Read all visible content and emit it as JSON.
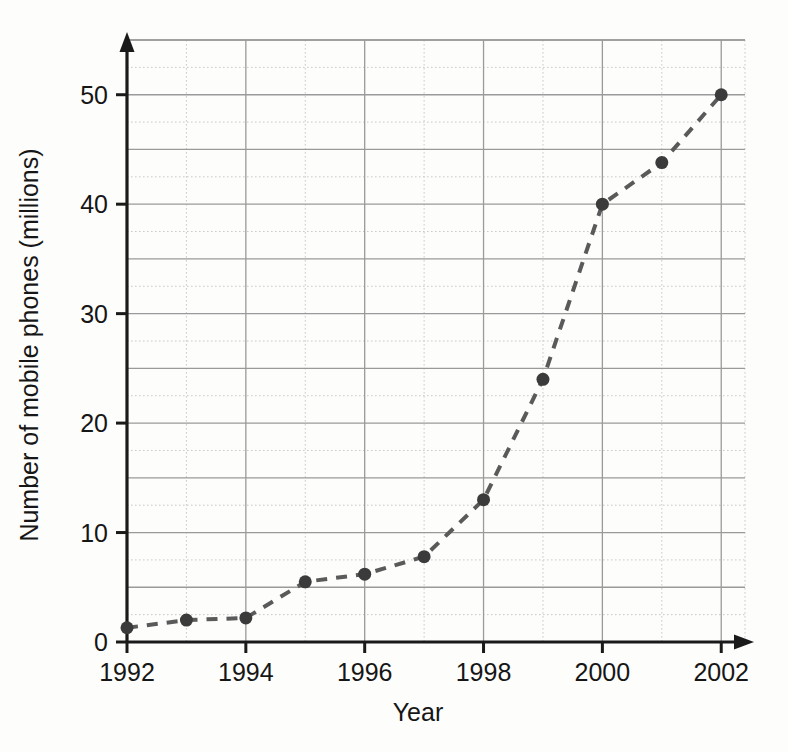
{
  "chart_data": {
    "type": "line",
    "title": "",
    "xlabel": "Year",
    "ylabel": "Number of mobile phones (millions)",
    "x": [
      1992,
      1993,
      1994,
      1995,
      1996,
      1997,
      1998,
      1999,
      2000,
      2001,
      2002
    ],
    "values": [
      1.3,
      2.0,
      2.2,
      5.5,
      6.2,
      7.8,
      13.0,
      24.0,
      40.0,
      43.8,
      50.0
    ],
    "series": [
      {
        "name": "Number of mobile phones (millions)",
        "values": [
          1.3,
          2.0,
          2.2,
          5.5,
          6.2,
          7.8,
          13.0,
          24.0,
          40.0,
          43.8,
          50.0
        ]
      }
    ],
    "xlim": [
      1992,
      2002.4
    ],
    "ylim": [
      0,
      55
    ],
    "x_tick_labels": [
      "1992",
      "1994",
      "1996",
      "1998",
      "2000",
      "2002"
    ],
    "x_tick_values": [
      1992,
      1994,
      1996,
      1998,
      2000,
      2002
    ],
    "y_tick_labels": [
      "0",
      "10",
      "20",
      "30",
      "40",
      "50"
    ],
    "y_tick_values": [
      0,
      10,
      20,
      30,
      40,
      50
    ],
    "x_major_gridline_step": 2,
    "x_minor_gridline_step": 1,
    "y_major_gridline_step": 5,
    "y_minor_gridline_step": 2.5,
    "grid": true,
    "legend": "none",
    "marker": "circle",
    "line_style": "dashed",
    "line_color": "#5a5a5a",
    "marker_color": "#3b3b3b",
    "major_grid_color": "#9a9a9a",
    "minor_grid_color": "#c9c9c9",
    "axis_color": "#1a1a1a",
    "background_color": "#fdfdfc"
  }
}
